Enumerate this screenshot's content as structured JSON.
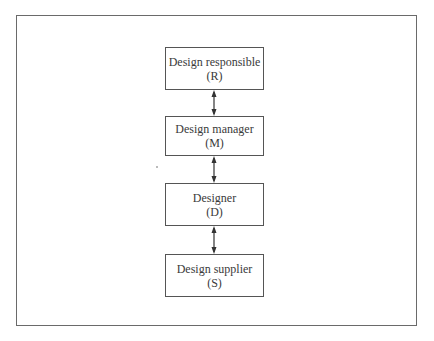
{
  "diagram": {
    "type": "hierarchy",
    "nodes": [
      {
        "label": "Design responsible",
        "code": "(R)"
      },
      {
        "label": "Design manager",
        "code": "(M)"
      },
      {
        "label": "Designer",
        "code": "(D)"
      },
      {
        "label": "Design supplier",
        "code": "(S)"
      }
    ],
    "edges": [
      {
        "from": "R",
        "to": "M",
        "style": "bidirectional-arrow"
      },
      {
        "from": "M",
        "to": "D",
        "style": "bidirectional-arrow"
      },
      {
        "from": "D",
        "to": "S",
        "style": "bidirectional-arrow"
      }
    ],
    "colors": {
      "line": "#555555",
      "text": "#3a3a3a",
      "background": "#ffffff"
    }
  }
}
